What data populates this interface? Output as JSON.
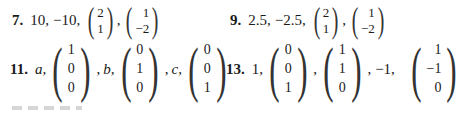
{
  "answers": [
    {
      "number": "7.",
      "eigenvalues": [
        "10,",
        "−10,"
      ],
      "vectors": [
        [
          "2",
          "1"
        ],
        [
          "1",
          "−2"
        ]
      ],
      "sep": ","
    },
    {
      "number": "9.",
      "eigenvalues": [
        "2.5,",
        "−2.5,"
      ],
      "vectors": [
        [
          "2",
          "1"
        ],
        [
          "1",
          "−2"
        ]
      ],
      "sep": ","
    },
    {
      "number": "11.",
      "labels": [
        "a,",
        "b,",
        "c,"
      ],
      "vectors": [
        [
          "1",
          "0",
          "0"
        ],
        [
          "0",
          "1",
          "0"
        ],
        [
          "0",
          "0",
          "1"
        ]
      ],
      "seps": [
        ",",
        ","
      ]
    },
    {
      "number": "13.",
      "labels": [
        "1,",
        "−1,"
      ],
      "vectors": [
        [
          "0",
          "0",
          "1"
        ],
        [
          "1",
          "1",
          "0"
        ],
        [
          "1",
          "−1",
          "0"
        ]
      ],
      "seps": [
        ",",
        ","
      ]
    }
  ]
}
